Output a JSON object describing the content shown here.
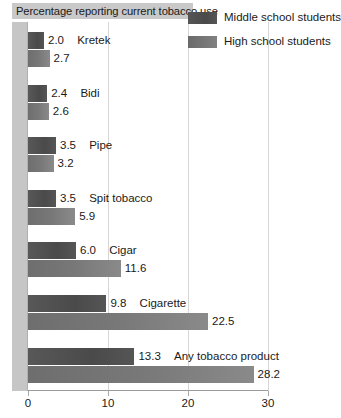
{
  "chart_data": {
    "type": "bar",
    "title": "Percentage reporting current tobacco use",
    "orientation": "horizontal",
    "xlabel": "",
    "ylabel": "",
    "xlim": [
      0,
      30
    ],
    "xticks": [
      0,
      10,
      20,
      30
    ],
    "xtick_labels": [
      "0",
      "10",
      "20",
      "30"
    ],
    "grid": true,
    "legend_position": "top-right",
    "categories": [
      "Kretek",
      "Bidi",
      "Pipe",
      "Spit tobacco",
      "Cigar",
      "Cigarette",
      "Any tobacco product"
    ],
    "series": [
      {
        "name": "Middle school students",
        "color": "#4f4f4f",
        "values": [
          2.0,
          2.4,
          3.5,
          3.5,
          6.0,
          9.8,
          13.3
        ],
        "value_labels": [
          "2.0",
          "2.4",
          "3.5",
          "3.5",
          "6.0",
          "9.8",
          "13.3"
        ]
      },
      {
        "name": "High school students",
        "color": "#787878",
        "values": [
          2.7,
          2.6,
          3.2,
          5.9,
          11.6,
          22.5,
          28.2
        ],
        "value_labels": [
          "2.7",
          "2.6",
          "3.2",
          "5.9",
          "11.6",
          "22.5",
          "28.2"
        ]
      }
    ]
  },
  "legend": {
    "items": [
      {
        "label": "Middle school students",
        "swatch": "middle"
      },
      {
        "label": "High school students",
        "swatch": "high"
      }
    ]
  },
  "colors": {
    "title_bar_bg": "#c9c9c9",
    "left_band": "#c6c6c6",
    "gridline": "#d6d6d6",
    "axis": "#9a9a9a",
    "text": "#1a1a1a"
  }
}
